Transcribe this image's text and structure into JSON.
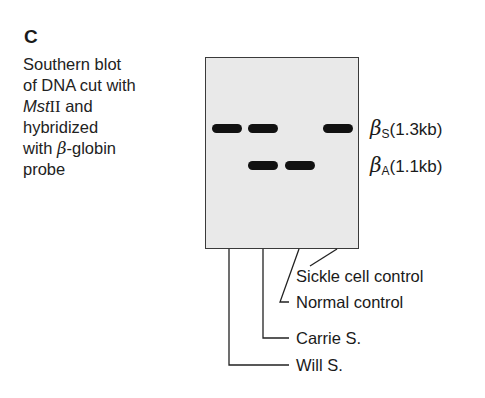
{
  "panel": {
    "letter": "C"
  },
  "caption": {
    "line1": "Southern blot",
    "line2": "of DNA cut with",
    "enzyme_italic": "Mst",
    "enzyme_roman": "II",
    "line3_rest": " and",
    "line4": "hybridized",
    "line5_pre": "with ",
    "beta": "β",
    "line5_post": "-globin",
    "line6": "probe"
  },
  "markers": [
    {
      "symbol": "β",
      "sub": "S",
      "size": "(1.3kb)"
    },
    {
      "symbol": "β",
      "sub": "A",
      "size": "(1.1kb)"
    }
  ],
  "lanes": [
    {
      "label": "Will S.",
      "bands": [
        "βS",
        "-"
      ]
    },
    {
      "label": "Carrie S.",
      "bands": [
        "βS",
        "βA"
      ]
    },
    {
      "label": "Normal control",
      "bands": [
        "-",
        "βA"
      ]
    },
    {
      "label": "Sickle cell control",
      "bands": [
        "βS",
        "-"
      ]
    }
  ],
  "colors": {
    "blot_bg": "#e9e9e9",
    "band": "#111111",
    "border": "#3a3a3a"
  }
}
